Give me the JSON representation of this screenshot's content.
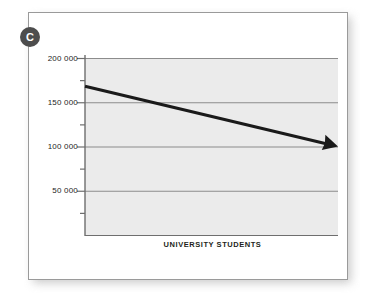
{
  "figure": {
    "badge_label": "C",
    "card_background": "#ffffff",
    "card_border_color": "#9a9a9a",
    "badge_color": "#4d4d4d"
  },
  "chart_data": {
    "type": "line",
    "title": "",
    "subtitle": "",
    "xlabel": "UNIVERSITY STUDENTS",
    "ylabel": "",
    "grid": true,
    "legend": "none",
    "plot_background": "#ebebeb",
    "line_color": "#1a1a1a",
    "gridline_color": "#8c8c8c",
    "axis_color": "#6e6e6e",
    "ylim": [
      0,
      200000
    ],
    "xlim": [
      0,
      100
    ],
    "ytick_labels": [
      "200 000",
      "150 000",
      "100 000",
      "50 000"
    ],
    "ytick_values": [
      200000,
      150000,
      100000,
      50000
    ],
    "yminor_values": [
      175000,
      125000,
      75000,
      25000
    ],
    "series": [
      {
        "name": "university students trend",
        "arrow": true,
        "x": [
          0,
          100
        ],
        "values": [
          168000,
          100000
        ]
      }
    ],
    "annotations": [
      "C"
    ]
  }
}
